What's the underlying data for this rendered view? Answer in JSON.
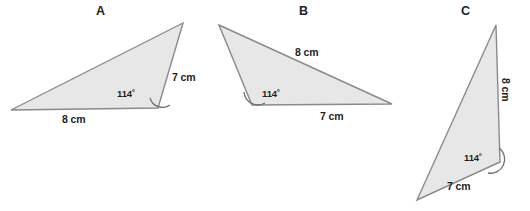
{
  "figure": {
    "type": "geometry-diagram",
    "background_color": "#ffffff",
    "fill_color": "#e7e7e7",
    "stroke_color": "#8a8a8a",
    "text_color": "#231f20"
  },
  "triangles": [
    {
      "id": "A",
      "label": "A",
      "label_pos": {
        "x": 96,
        "y": 5
      },
      "vertices": [
        {
          "x": 11,
          "y": 110
        },
        {
          "x": 158,
          "y": 108
        },
        {
          "x": 183,
          "y": 23
        }
      ],
      "sides": [
        {
          "name": "base",
          "value": "8 cm",
          "pos": {
            "x": 62,
            "y": 114
          }
        },
        {
          "name": "right-edge",
          "value": "7 cm",
          "pos": {
            "x": 172,
            "y": 72
          }
        }
      ],
      "angle": {
        "value": "114˚",
        "pos": {
          "x": 117,
          "y": 89
        },
        "vertex": {
          "x": 158,
          "y": 108
        },
        "arc": "M 170 105 A 13 13 0 0 1 150 98"
      }
    },
    {
      "id": "B",
      "label": "B",
      "label_pos": {
        "x": 299,
        "y": 5
      },
      "vertices": [
        {
          "x": 219,
          "y": 25
        },
        {
          "x": 392,
          "y": 104
        },
        {
          "x": 252,
          "y": 105
        }
      ],
      "sides": [
        {
          "name": "hypotenuse",
          "value": "8 cm",
          "pos": {
            "x": 295,
            "y": 47
          }
        },
        {
          "name": "base",
          "value": "7 cm",
          "pos": {
            "x": 320,
            "y": 111
          }
        }
      ],
      "angle": {
        "value": "114˚",
        "pos": {
          "x": 262,
          "y": 89
        },
        "vertex": {
          "x": 252,
          "y": 105
        },
        "arc": "M 265 103 A 14 14 0 0 1 244 92"
      }
    },
    {
      "id": "C",
      "label": "C",
      "label_pos": {
        "x": 461,
        "y": 5
      },
      "vertices": [
        {
          "x": 496,
          "y": 25
        },
        {
          "x": 500,
          "y": 162
        },
        {
          "x": 417,
          "y": 200
        }
      ],
      "sides": [
        {
          "name": "vertical-edge",
          "value": "8 cm",
          "pos": {
            "x": 503,
            "y": 88
          }
        },
        {
          "name": "lower-edge",
          "value": "7 cm",
          "pos": {
            "x": 447,
            "y": 181
          }
        }
      ],
      "angle": {
        "value": "114˚",
        "pos": {
          "x": 464,
          "y": 153
        },
        "vertex": {
          "x": 500,
          "y": 162
        },
        "arc": "M 499 148 A 14 14 0 0 1 488 173"
      }
    }
  ]
}
